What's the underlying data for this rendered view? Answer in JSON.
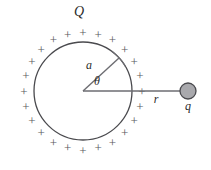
{
  "figure": {
    "type": "physics-diagram",
    "background_color": "#ffffff",
    "width": 211,
    "height": 170,
    "sphere": {
      "center_x": 83,
      "center_y": 91,
      "radius": 49,
      "stroke_color": "#4a4a4e",
      "stroke_width": 1.3,
      "fill": "none",
      "charge_label": "Q",
      "charge_label_x": 79,
      "charge_label_y": 16,
      "charge_label_size": 14
    },
    "surface_charges": {
      "symbol": "+",
      "count": 24,
      "ring_radius": 59,
      "color": "#58585c",
      "font_size": 13,
      "start_angle_deg": 90,
      "note": "plus signs distributed around the outside of the sphere"
    },
    "radius_line": {
      "label": "a",
      "label_x": 89,
      "label_y": 69,
      "label_size": 12,
      "angle_deg": 43,
      "from_x": 83,
      "from_y": 91,
      "to_x": 119,
      "to_y": 58,
      "stroke_color": "#6d6d72",
      "stroke_width": 1.4
    },
    "angle_arc": {
      "label": "θ",
      "label_x": 97,
      "label_y": 85,
      "label_size": 12,
      "italic": false
    },
    "distance_line": {
      "label": "r",
      "label_x": 156,
      "label_y": 103,
      "label_size": 12,
      "from_x": 83,
      "from_y": 91,
      "to_x": 180,
      "to_y": 91,
      "stroke_color": "#6d6d72",
      "stroke_width": 1.6
    },
    "point_charge": {
      "label": "q",
      "label_x": 188,
      "label_y": 110,
      "label_size": 12,
      "center_x": 188,
      "center_y": 91,
      "radius": 8,
      "fill_color": "#a9a9ad",
      "stroke_color": "#4a4a4e",
      "stroke_width": 1.3
    }
  }
}
